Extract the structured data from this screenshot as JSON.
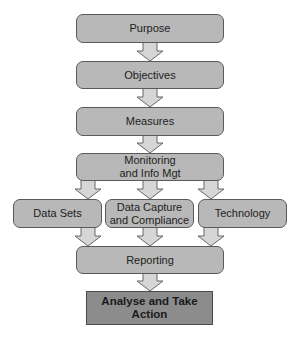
{
  "diagram": {
    "type": "flowchart",
    "nodes": {
      "purpose": "Purpose",
      "objectives": "Objectives",
      "measures": "Measures",
      "monitoring_line1": "Monitoring",
      "monitoring_line2": "and Info Mgt",
      "data_sets": "Data Sets",
      "data_capture_line1": "Data Capture",
      "data_capture_line2": "and Compliance",
      "technology": "Technology",
      "reporting": "Reporting",
      "analyse": "Analyse and Take Action"
    },
    "edges": [
      [
        "Purpose",
        "Objectives"
      ],
      [
        "Objectives",
        "Measures"
      ],
      [
        "Measures",
        "Monitoring and Info Mgt"
      ],
      [
        "Monitoring and Info Mgt",
        "Data Sets"
      ],
      [
        "Monitoring and Info Mgt",
        "Data Capture and Compliance"
      ],
      [
        "Monitoring and Info Mgt",
        "Technology"
      ],
      [
        "Data Sets",
        "Reporting"
      ],
      [
        "Data Capture and Compliance",
        "Reporting"
      ],
      [
        "Technology",
        "Reporting"
      ],
      [
        "Reporting",
        "Analyse and Take Action"
      ]
    ],
    "colors": {
      "box_fill": "#b8b8b8",
      "final_box_fill": "#8c8c8c",
      "arrow_fill": "#d6d6d6",
      "border": "#5a5a5a"
    }
  }
}
